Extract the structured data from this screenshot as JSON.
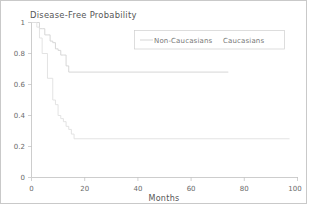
{
  "figure": {
    "title": "Disease-Free Probability",
    "background_color": "#ffffff",
    "border_color": "#c9c9c9"
  },
  "axes": {
    "x_label": "Months",
    "y_label": "",
    "x_ticks": [
      "0",
      "20",
      "40",
      "60",
      "80",
      "100"
    ],
    "y_ticks": [
      "0",
      "0.2",
      "0.4",
      "0.6",
      "0.8",
      "1"
    ]
  },
  "legend": {
    "entries": [
      {
        "label": "Non-Caucasians",
        "color": "#d2d2d2",
        "has_marker": true
      },
      {
        "label": "Caucasians",
        "color": "#e0e0e0",
        "has_marker": false
      }
    ]
  },
  "chart_data": {
    "type": "line",
    "subtype": "kaplan-meier-step",
    "title": "Disease-Free Probability",
    "xlabel": "Months",
    "ylabel": "Disease-Free Probability",
    "xlim": [
      0,
      100
    ],
    "ylim": [
      0,
      1
    ],
    "xticks": [
      0,
      20,
      40,
      60,
      80,
      100
    ],
    "yticks": [
      0,
      0.2,
      0.4,
      0.6,
      0.8,
      1
    ],
    "grid": false,
    "legend_position": "top-right",
    "series": [
      {
        "name": "Non-Caucasians",
        "color": "#d2d2d2",
        "step": "post",
        "x": [
          0,
          2,
          3,
          4,
          5,
          6,
          7,
          8,
          9,
          10,
          11,
          12,
          13,
          14,
          74
        ],
        "y": [
          1.0,
          1.0,
          0.96,
          0.96,
          0.92,
          0.92,
          0.88,
          0.87,
          0.83,
          0.82,
          0.79,
          0.79,
          0.72,
          0.68,
          0.68
        ],
        "plateau_value": 0.68,
        "last_x": 74
      },
      {
        "name": "Caucasians",
        "color": "#e0e0e0",
        "step": "post",
        "x": [
          0,
          1,
          2,
          3,
          4,
          6,
          8,
          9,
          10,
          11,
          12,
          13,
          14,
          15,
          16,
          97
        ],
        "y": [
          1.0,
          1.0,
          0.97,
          0.9,
          0.8,
          0.64,
          0.5,
          0.47,
          0.4,
          0.38,
          0.36,
          0.33,
          0.31,
          0.28,
          0.25,
          0.25
        ],
        "plateau_value": 0.25,
        "last_x": 97
      }
    ]
  }
}
